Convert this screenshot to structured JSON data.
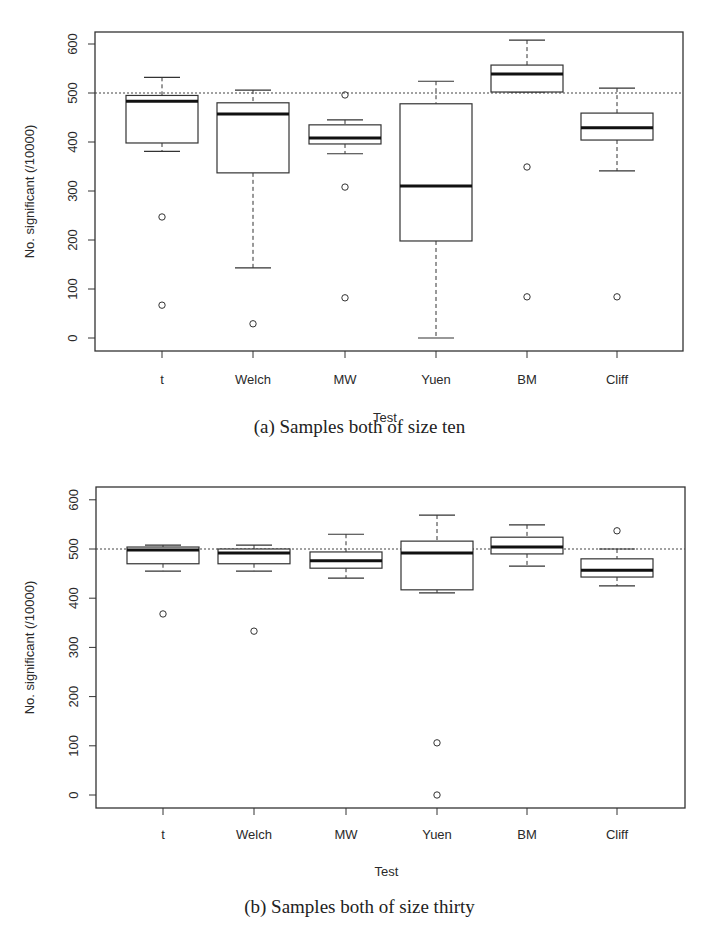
{
  "chart_data": [
    {
      "type": "box",
      "title": "(a) Samples both of size ten",
      "xlabel": "Test",
      "ylabel": "No. significant (/10000)",
      "ylim": [
        -25,
        625
      ],
      "yticks": [
        0,
        100,
        200,
        300,
        400,
        500,
        600
      ],
      "reference_line": 500,
      "grid": false,
      "categories": [
        "t",
        "Welch",
        "MW",
        "Yuen",
        "BM",
        "Cliff"
      ],
      "boxes": [
        {
          "name": "t",
          "whisker_low": 381,
          "q1": 398,
          "median": 483,
          "q3": 495,
          "whisker_high": 532,
          "outliers": [
            247,
            67
          ]
        },
        {
          "name": "Welch",
          "whisker_low": 143,
          "q1": 337,
          "median": 457,
          "q3": 480,
          "whisker_high": 506,
          "outliers": [
            29
          ]
        },
        {
          "name": "MW",
          "whisker_low": 376,
          "q1": 396,
          "median": 408,
          "q3": 435,
          "whisker_high": 445,
          "outliers": [
            496,
            308,
            82
          ]
        },
        {
          "name": "Yuen",
          "whisker_low": 0,
          "q1": 198,
          "median": 310,
          "q3": 478,
          "whisker_high": 524,
          "outliers": []
        },
        {
          "name": "BM",
          "whisker_low": 502,
          "q1": 502,
          "median": 539,
          "q3": 557,
          "whisker_high": 608,
          "outliers": [
            349,
            84
          ]
        },
        {
          "name": "Cliff",
          "whisker_low": 341,
          "q1": 404,
          "median": 429,
          "q3": 459,
          "whisker_high": 510,
          "outliers": [
            84
          ]
        }
      ]
    },
    {
      "type": "box",
      "title": "(b) Samples both of size thirty",
      "xlabel": "Test",
      "ylabel": "No. significant (/10000)",
      "ylim": [
        -25,
        625
      ],
      "yticks": [
        0,
        100,
        200,
        300,
        400,
        500,
        600
      ],
      "reference_line": 500,
      "grid": false,
      "categories": [
        "t",
        "Welch",
        "MW",
        "Yuen",
        "BM",
        "Cliff"
      ],
      "boxes": [
        {
          "name": "t",
          "whisker_low": 455,
          "q1": 470,
          "median": 498,
          "q3": 504,
          "whisker_high": 508,
          "outliers": [
            368
          ]
        },
        {
          "name": "Welch",
          "whisker_low": 455,
          "q1": 470,
          "median": 492,
          "q3": 500,
          "whisker_high": 508,
          "outliers": [
            333
          ]
        },
        {
          "name": "MW",
          "whisker_low": 441,
          "q1": 461,
          "median": 476,
          "q3": 494,
          "whisker_high": 530,
          "outliers": []
        },
        {
          "name": "Yuen",
          "whisker_low": 411,
          "q1": 417,
          "median": 492,
          "q3": 516,
          "whisker_high": 569,
          "outliers": [
            106,
            0
          ]
        },
        {
          "name": "BM",
          "whisker_low": 465,
          "q1": 490,
          "median": 504,
          "q3": 524,
          "whisker_high": 549,
          "outliers": []
        },
        {
          "name": "Cliff",
          "whisker_low": 425,
          "q1": 443,
          "median": 457,
          "q3": 480,
          "whisker_high": 500,
          "outliers": [
            537
          ]
        }
      ]
    }
  ],
  "figures": {
    "a": {
      "caption": "(a) Samples both of size ten",
      "xlabel": "Test",
      "ylabel": "No. significant (/10000)"
    },
    "b": {
      "caption": "(b) Samples both of size thirty",
      "xlabel": "Test",
      "ylabel": "No. significant (/10000)"
    }
  }
}
